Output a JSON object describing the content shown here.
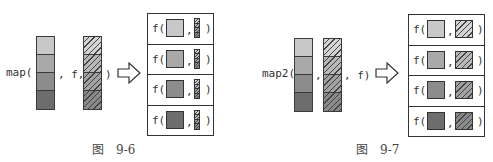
{
  "colors": {
    "shade_1": "#c8c8c8",
    "shade_2": "#a9a9a9",
    "shade_3": "#8c8c8c",
    "shade_4": "#6d6d6d",
    "hatch_bg_1": "#d4d4d4",
    "hatch_bg_2": "#b8b8b8",
    "hatch_bg_3": "#a2a2a2",
    "hatch_bg_4": "#8a8a8a",
    "outline": "#333333"
  },
  "figure_96": {
    "call_prefix": "map(",
    "mid_text": ", f,",
    "close_paren": ")",
    "result_rows": [
      {
        "fn": "f(",
        "sep": ",",
        "close": ")"
      },
      {
        "fn": "f(",
        "sep": ",",
        "close": ")"
      },
      {
        "fn": "f(",
        "sep": ",",
        "close": ")"
      },
      {
        "fn": "f(",
        "sep": ",",
        "close": ")"
      }
    ],
    "caption_label": "图",
    "caption_number": "9-6",
    "arrow_icon": "hollow-right-arrow"
  },
  "figure_97": {
    "call_prefix": "map2(",
    "mid_text": ",",
    "tail_text": ", f)",
    "result_rows": [
      {
        "fn": "f(",
        "sep": ",",
        "close": ")"
      },
      {
        "fn": "f(",
        "sep": ",",
        "close": ")"
      },
      {
        "fn": "f(",
        "sep": ",",
        "close": ")"
      },
      {
        "fn": "f(",
        "sep": ",",
        "close": ")"
      }
    ],
    "caption_label": "图",
    "caption_number": "9-7",
    "arrow_icon": "hollow-right-arrow"
  }
}
